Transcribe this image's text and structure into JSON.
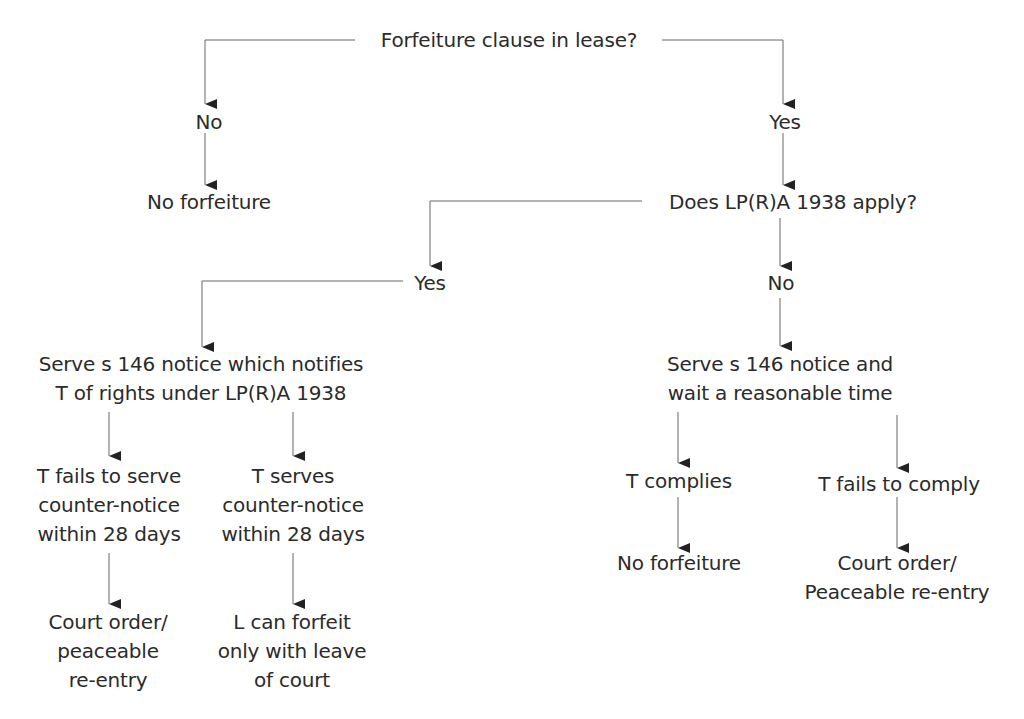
{
  "diagram": {
    "type": "flowchart",
    "title": "Forfeiture clause in lease?",
    "nodes": {
      "root": "Forfeiture clause in lease?",
      "no_clause": "No",
      "no_clause_result": "No forfeiture",
      "yes_clause": "Yes",
      "lpra_question": "Does LP(R)A 1938 apply?",
      "lpra_yes": "Yes",
      "lpra_no": "No",
      "notice_lpra": [
        "Serve s 146 notice which notifies",
        "T of rights under LP(R)A 1938"
      ],
      "t_fails_counter": [
        "T fails to serve",
        "counter-notice",
        "within 28 days"
      ],
      "t_serves_counter": [
        "T serves",
        "counter-notice",
        "within 28 days"
      ],
      "result_fails_counter": [
        "Court order/",
        "peaceable",
        "re-entry"
      ],
      "result_serves_counter": [
        "L can forfeit",
        "only with leave",
        "of court"
      ],
      "notice_wait": [
        "Serve s 146 notice and",
        "wait a reasonable time"
      ],
      "t_complies": "T complies",
      "t_fails_comply": "T fails to comply",
      "result_complies": "No forfeiture",
      "result_fails_comply": [
        "Court order/",
        "Peaceable re-entry"
      ]
    },
    "edges": [
      [
        "root",
        "no_clause"
      ],
      [
        "no_clause",
        "no_clause_result"
      ],
      [
        "root",
        "yes_clause"
      ],
      [
        "yes_clause",
        "lpra_question"
      ],
      [
        "lpra_question",
        "lpra_yes"
      ],
      [
        "lpra_question",
        "lpra_no"
      ],
      [
        "lpra_yes",
        "notice_lpra"
      ],
      [
        "notice_lpra",
        "t_fails_counter"
      ],
      [
        "notice_lpra",
        "t_serves_counter"
      ],
      [
        "t_fails_counter",
        "result_fails_counter"
      ],
      [
        "t_serves_counter",
        "result_serves_counter"
      ],
      [
        "lpra_no",
        "notice_wait"
      ],
      [
        "notice_wait",
        "t_complies"
      ],
      [
        "notice_wait",
        "t_fails_comply"
      ],
      [
        "t_complies",
        "result_complies"
      ],
      [
        "t_fails_comply",
        "result_fails_comply"
      ]
    ],
    "colors": {
      "line": "#555555",
      "arrow": "#222222",
      "text": "#2b2b2b"
    }
  }
}
